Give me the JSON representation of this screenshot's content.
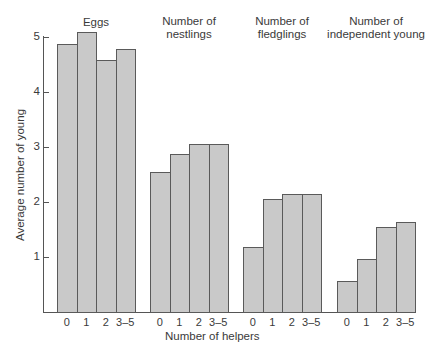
{
  "chart_data": {
    "type": "bar",
    "title": "",
    "xlabel": "Number of helpers",
    "ylabel": "Average number of young",
    "ylim": [
      0,
      5
    ],
    "yticks": [
      1,
      2,
      3,
      4,
      5
    ],
    "grid": false,
    "legend": null,
    "categories": [
      "0",
      "1",
      "2",
      "3–5"
    ],
    "series": [
      {
        "name": "Eggs",
        "values": [
          4.87,
          5.09,
          4.58,
          4.78
        ]
      },
      {
        "name": "Number of nestlings",
        "values": [
          2.55,
          2.87,
          3.05,
          3.05
        ]
      },
      {
        "name": "Number of fledglings",
        "values": [
          1.18,
          2.05,
          2.15,
          2.15
        ]
      },
      {
        "name": "Number of independent young",
        "values": [
          0.56,
          0.96,
          1.55,
          1.64
        ]
      }
    ]
  },
  "labels": {
    "group_titles": [
      "Eggs",
      "Number of\nnestlings",
      "Number of\nfledglings",
      "Number of\nindependent young"
    ],
    "xlabel": "Number of helpers",
    "ylabel": "Average number of young",
    "ytick_labels": [
      "1",
      "2",
      "3",
      "4",
      "5"
    ]
  },
  "colors": {
    "bar_fill": "#c9c9c9",
    "bar_border": "#5a5a5a",
    "axis": "#555555",
    "text": "#3a3a3a"
  }
}
